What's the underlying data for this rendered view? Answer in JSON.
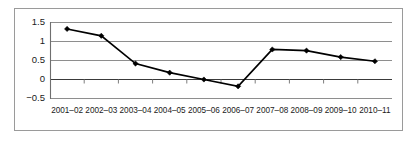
{
  "chart_data": {
    "type": "line",
    "title": "",
    "subtitle": "",
    "xlabel": "",
    "ylabel": "",
    "categories": [
      "2001–02",
      "2002–03",
      "2003–04",
      "2004–05",
      "2005–06",
      "2006–07",
      "2007–08",
      "2008–09",
      "2009–10",
      "2010–11"
    ],
    "values": [
      1.33,
      1.15,
      0.42,
      0.18,
      0.0,
      -0.18,
      0.79,
      0.76,
      0.59,
      0.48
    ],
    "series": [
      {
        "name": "series-1",
        "values": [
          1.33,
          1.15,
          0.42,
          0.18,
          0.0,
          -0.18,
          0.79,
          0.76,
          0.59,
          0.48
        ]
      }
    ],
    "ylim": [
      -0.5,
      1.5
    ],
    "yticks": [
      1.5,
      1,
      0.5,
      0,
      -0.5
    ],
    "ytick_labels": [
      "1.5",
      "1",
      "0.5",
      "0",
      "−0.5"
    ],
    "grid": true,
    "grid_axis": "y",
    "legend": false,
    "legend_position": "none",
    "marker": "diamond",
    "line_color": "#000000",
    "grid_color": "#8e8e8e",
    "border_color": "#9a9a9a",
    "background_color": "#ffffff"
  }
}
